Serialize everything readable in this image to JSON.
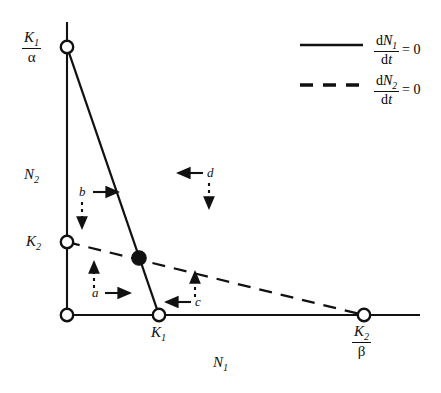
{
  "figure": {
    "type": "phase-plane-diagram",
    "background_color": "#ffffff",
    "line_color": "#111111",
    "width": 441,
    "height": 393
  },
  "axes": {
    "x_label": "N",
    "x_label_sub": "1",
    "y_label": "N",
    "y_label_sub": "2",
    "x_axis_y_px": 315,
    "y_axis_x_px": 67,
    "x_axis_start_px": 67,
    "x_axis_end_px": 420,
    "y_axis_top_px": 22,
    "y_axis_bottom_px": 315
  },
  "ticks": {
    "y_top": {
      "numerator": "K",
      "numerator_sub": "1",
      "denominator": "α",
      "value_px_x": 67,
      "value_px_y": 47
    },
    "y_mid": {
      "label": "K",
      "label_sub": "2",
      "value_px_x": 67,
      "value_px_y": 242
    },
    "x_mid": {
      "label": "K",
      "label_sub": "1",
      "value_px_x": 159,
      "value_px_y": 315
    },
    "x_right": {
      "numerator": "K",
      "numerator_sub": "2",
      "denominator": "β",
      "value_px_x": 364,
      "value_px_y": 315
    },
    "origin": {
      "value_px_x": 67,
      "value_px_y": 315
    }
  },
  "isoclines": [
    {
      "id": "dN1dt",
      "style": "solid",
      "from": {
        "x": 67,
        "y": 47
      },
      "to": {
        "x": 159,
        "y": 315
      },
      "meaning": "dN1/dt = 0"
    },
    {
      "id": "dN2dt",
      "style": "dashed",
      "from": {
        "x": 67,
        "y": 242
      },
      "to": {
        "x": 364,
        "y": 315
      },
      "meaning": "dN2/dt = 0"
    }
  ],
  "equilibrium": {
    "name": "stable-equilibrium-point",
    "filled": true,
    "x": 139,
    "y": 258
  },
  "open_points": [
    {
      "name": "point-k1-over-alpha",
      "x": 67,
      "y": 47
    },
    {
      "name": "point-k2",
      "x": 67,
      "y": 242
    },
    {
      "name": "point-origin",
      "x": 67,
      "y": 315
    },
    {
      "name": "point-k1",
      "x": 159,
      "y": 315
    },
    {
      "name": "point-k2-over-beta",
      "x": 364,
      "y": 315
    }
  ],
  "regions": [
    {
      "id": "a",
      "label": "a",
      "label_x": 96,
      "label_y": 296,
      "solid_arrow": "right",
      "dashed_arrow": "up",
      "solid_arrow_x": 105,
      "solid_arrow_y": 293,
      "dashed_arrow_x": 94,
      "dashed_arrow_y": 266
    },
    {
      "id": "b",
      "label": "b",
      "label_x": 83,
      "label_y": 196,
      "solid_arrow": "right",
      "dashed_arrow": "down",
      "solid_arrow_x": 93,
      "solid_arrow_y": 193,
      "dashed_arrow_x": 82,
      "dashed_arrow_y": 206
    },
    {
      "id": "c",
      "label": "c",
      "label_x": 196,
      "label_y": 305,
      "solid_arrow": "left",
      "dashed_arrow": "up",
      "solid_arrow_x": 166,
      "solid_arrow_y": 302,
      "dashed_arrow_x": 195,
      "dashed_arrow_y": 275
    },
    {
      "id": "d",
      "label": "d",
      "label_x": 207,
      "label_y": 176,
      "solid_arrow": "left",
      "dashed_arrow": "down",
      "solid_arrow_x": 178,
      "solid_arrow_y": 173,
      "dashed_arrow_x": 209,
      "dashed_arrow_y": 186
    }
  ],
  "legend": {
    "entries": [
      {
        "id": "legend-dn1",
        "style": "solid",
        "numerator_d": "d",
        "numerator_n": "N",
        "numerator_sub": "1",
        "denominator": "dt",
        "rhs": "= 0",
        "line_x1": 300,
        "line_x2": 363,
        "line_y": 45
      },
      {
        "id": "legend-dn2",
        "style": "dashed",
        "numerator_d": "d",
        "numerator_n": "N",
        "numerator_sub": "2",
        "denominator": "dt",
        "rhs": "= 0",
        "line_x1": 300,
        "line_x2": 363,
        "line_y": 85
      }
    ]
  }
}
